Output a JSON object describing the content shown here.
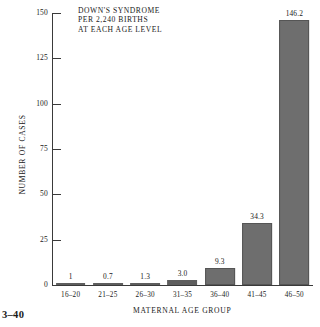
{
  "figure": {
    "number": "3–40"
  },
  "chart_data": {
    "type": "bar",
    "title": "DOWN'S SYNDROME PER 2,240 BIRTHS AT EACH AGE LEVEL",
    "title_lines": [
      "DOWN'S SYNDROME",
      "PER 2,240 BIRTHS",
      "AT EACH  AGE LEVEL"
    ],
    "xlabel": "MATERNAL AGE GROUP",
    "ylabel": "NUMBER OF CASES",
    "categories": [
      "16–20",
      "21–25",
      "26–30",
      "31–35",
      "36–40",
      "41–45",
      "46–50"
    ],
    "values": [
      1,
      0.7,
      1.3,
      3.0,
      9.3,
      34.3,
      146.2
    ],
    "value_labels": [
      "1",
      "0.7",
      "1.3",
      "3.0",
      "9.3",
      "34.3",
      "146.2"
    ],
    "ylim": [
      0,
      150
    ],
    "yticks": [
      0,
      25,
      50,
      75,
      100,
      125,
      150
    ],
    "ytick_labels": [
      "0",
      "25",
      "50",
      "75",
      "100",
      "125",
      "150"
    ],
    "grid": false,
    "legend": false,
    "bar_color": "#6e6e6e",
    "axis_color": "#3a3a3a"
  }
}
